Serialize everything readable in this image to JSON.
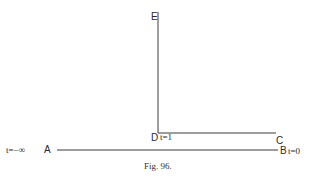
{
  "figure": {
    "caption": "Fig. 96.",
    "line_color": "#3a3a3a"
  },
  "points": {
    "E": {
      "label": "E"
    },
    "D": {
      "label": "D",
      "param": "t=1"
    },
    "C": {
      "label": "C"
    },
    "A": {
      "label": "A",
      "param": "t=−∞"
    },
    "B": {
      "label": "B",
      "param": "t=0"
    }
  },
  "segments": [
    {
      "from": "E",
      "to": "D"
    },
    {
      "from": "D",
      "to": "C"
    },
    {
      "from": "A",
      "to": "B"
    }
  ]
}
